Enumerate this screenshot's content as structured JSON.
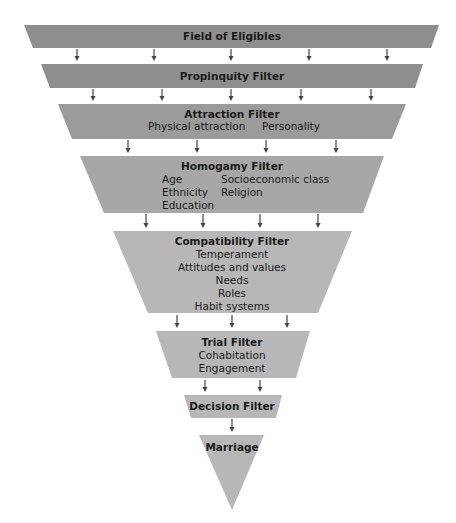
{
  "diagram": {
    "colors": {
      "band_dark": "#8e8e8e",
      "band_mid": "#9b9b9b",
      "band_mid2": "#a7a7a7",
      "band_light": "#b7b7b7",
      "arrow": "#444444"
    },
    "stages": [
      {
        "id": "field-of-eligibles",
        "title": "Field of Eligibles",
        "items": [],
        "shape": {
          "top_y": 25,
          "bottom_y": 48,
          "top_l": 24,
          "top_r": 439,
          "bot_l": 33,
          "bot_r": 431
        },
        "color": "band_dark",
        "arrows_below": {
          "xs": [
            77,
            154,
            231,
            309,
            387
          ],
          "y1": 49,
          "y2": 61
        }
      },
      {
        "id": "propinquity-filter",
        "title": "Propinquity Filter",
        "items": [],
        "shape": {
          "top_y": 64,
          "bottom_y": 88,
          "top_l": 41,
          "top_r": 423,
          "bot_l": 50,
          "bot_r": 415
        },
        "color": "band_dark",
        "arrows_below": {
          "xs": [
            93,
            162,
            231,
            301,
            371
          ],
          "y1": 89,
          "y2": 101
        }
      },
      {
        "id": "attraction-filter",
        "title": "Attraction Filter",
        "items": [
          "Physical attraction",
          "Personality"
        ],
        "shape": {
          "top_y": 104,
          "bottom_y": 139,
          "top_l": 58,
          "top_r": 406,
          "bot_l": 72,
          "bot_r": 392
        },
        "color": "band_mid",
        "arrows_below": {
          "xs": [
            128,
            197,
            266,
            336
          ],
          "y1": 140,
          "y2": 153
        }
      },
      {
        "id": "homogamy-filter",
        "title": "Homogamy Filter",
        "items": [
          "Age",
          "Socioeconomic class",
          "Ethnicity",
          "Religion",
          "Education"
        ],
        "shape": {
          "top_y": 156,
          "bottom_y": 213,
          "top_l": 80,
          "top_r": 384,
          "bot_l": 104,
          "bot_r": 363
        },
        "color": "band_mid2",
        "arrows_below": {
          "xs": [
            146,
            203,
            260,
            318
          ],
          "y1": 214,
          "y2": 228
        }
      },
      {
        "id": "compatibility-filter",
        "title": "Compatibility Filter",
        "items": [
          "Temperament",
          "Attitudes and values",
          "Needs",
          "Roles",
          "Habit systems"
        ],
        "shape": {
          "top_y": 231,
          "bottom_y": 313,
          "top_l": 113,
          "top_r": 352,
          "bot_l": 148,
          "bot_r": 318
        },
        "color": "band_light",
        "arrows_below": {
          "xs": [
            177,
            232,
            287
          ],
          "y1": 315,
          "y2": 328
        }
      },
      {
        "id": "trial-filter",
        "title": "Trial Filter",
        "items": [
          "Cohabitation",
          "Engagement"
        ],
        "shape": {
          "top_y": 331,
          "bottom_y": 378,
          "top_l": 156,
          "top_r": 310,
          "bot_l": 172,
          "bot_r": 296
        },
        "color": "band_light",
        "arrows_below": {
          "xs": [
            205,
            260
          ],
          "y1": 380,
          "y2": 392
        }
      },
      {
        "id": "decision-filter",
        "title": "Decision Filter",
        "items": [],
        "shape": {
          "top_y": 395,
          "bottom_y": 418,
          "top_l": 184,
          "top_r": 282,
          "bot_l": 191,
          "bot_r": 276
        },
        "color": "band_light",
        "arrows_below": {
          "xs": [
            232
          ],
          "y1": 419,
          "y2": 432
        }
      },
      {
        "id": "marriage",
        "title": "Marriage",
        "items": [],
        "shape": {
          "top_y": 435,
          "bottom_y": 510,
          "top_l": 199,
          "top_r": 264,
          "bot_l": 232,
          "bot_r": 232
        },
        "color": "band_light",
        "arrows_below": {
          "xs": [],
          "y1": 0,
          "y2": 0
        }
      }
    ]
  }
}
